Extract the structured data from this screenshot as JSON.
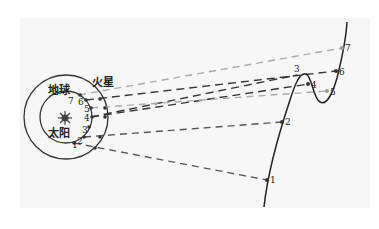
{
  "labels": {
    "earth": "地球",
    "mars": "火星",
    "sun": "太阳"
  },
  "earth_positions": [
    "1",
    "2",
    "3",
    "4",
    "5",
    "6",
    "7"
  ],
  "mars_positions": [
    "1",
    "2",
    "3",
    "4",
    "5",
    "6",
    "7"
  ],
  "sky_positions": [
    "1",
    "2",
    "3",
    "4",
    "5",
    "6",
    "7"
  ],
  "colors": {
    "line_dark": "#333333",
    "line_light": "#aaaaaa",
    "background": "#f7f7f7"
  }
}
